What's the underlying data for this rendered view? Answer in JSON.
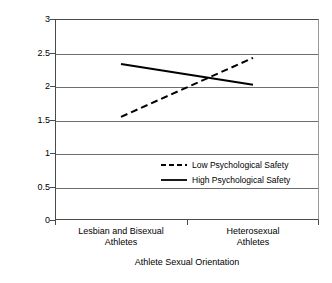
{
  "chart_data": {
    "type": "line",
    "title": "",
    "xlabel": "Athlete Sexual Orientation",
    "ylabel": "Sexual Orientation Personal Identity",
    "categories": [
      "Lesbian and Bisexual Athletes",
      "Heterosexual Athletes"
    ],
    "category_lines": [
      [
        "Lesbian and Bisexual",
        "Athletes"
      ],
      [
        "Heterosexual",
        "Athletes"
      ]
    ],
    "ylim": [
      0,
      3
    ],
    "yticks": [
      3,
      2.5,
      2,
      1.5,
      1,
      0.5,
      0
    ],
    "ytick_labels": [
      "3",
      "2.5",
      "2",
      "1.5",
      "1",
      "0.5",
      "0"
    ],
    "grid": true,
    "grid_axis": "y",
    "legend_position": "center-right-inside",
    "series": [
      {
        "name": "Low Psychological Safety",
        "style": "dashed",
        "color": "#000000",
        "values": [
          1.54,
          2.42
        ]
      },
      {
        "name": "High Psychological Safety",
        "style": "solid",
        "color": "#000000",
        "values": [
          2.33,
          2.02
        ]
      }
    ]
  },
  "legend": {
    "items": [
      {
        "label": "Low Psychological Safety",
        "style": "dashed"
      },
      {
        "label": "High Psychological Safety",
        "style": "solid"
      }
    ]
  },
  "colors": {
    "axis": "#4a4a4a",
    "grid": "#6e6e6e",
    "series": "#000000",
    "background": "#ffffff"
  }
}
